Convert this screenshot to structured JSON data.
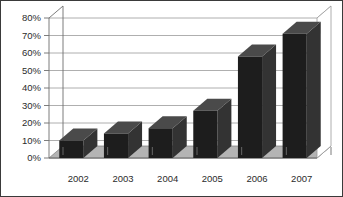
{
  "chart_data": {
    "type": "bar",
    "title": "",
    "subtitle": "",
    "xlabel": "",
    "ylabel": "",
    "categories": [
      "2002",
      "2003",
      "2004",
      "2005",
      "2006",
      "2007"
    ],
    "values": [
      10,
      14,
      17,
      27,
      58,
      71
    ],
    "value_labels": [
      "10%",
      "14%",
      "17%",
      "27%",
      "58%",
      "71%"
    ],
    "ylim": [
      0,
      80
    ],
    "ytick_values": [
      0,
      10,
      20,
      30,
      40,
      50,
      60,
      70,
      80
    ],
    "ytick_labels": [
      "0%",
      "10%",
      "20%",
      "30%",
      "40%",
      "50%",
      "60%",
      "70%",
      "80%"
    ],
    "grid": true,
    "grid_axis": "y",
    "legend": false,
    "legend_position": "none",
    "series": [
      {
        "name": "",
        "values": [
          10,
          14,
          17,
          27,
          58,
          71
        ]
      }
    ],
    "style": {
      "three_d": true,
      "bar_color": "#1d1d1d",
      "bar_top_color": "#4a4a4a",
      "bar_side_color": "#333333",
      "gridline_color": "#9a9a9a",
      "axis_color": "#6e6e6e",
      "floor_color": "#b4b4b4",
      "plot_background": "#ffffff",
      "frame_color": "#3a3a3a"
    }
  }
}
